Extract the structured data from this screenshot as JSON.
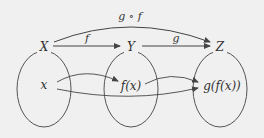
{
  "diagram": {
    "type": "function-composition-mapping",
    "background": "#f0f0f0",
    "stroke_color": "#555555",
    "sets": [
      {
        "id": "X",
        "label": "X",
        "element": "x"
      },
      {
        "id": "Y",
        "label": "Y",
        "element": "f(x)"
      },
      {
        "id": "Z",
        "label": "Z",
        "element": "g(f(x))"
      }
    ],
    "arrows": [
      {
        "from": "X",
        "to": "Y",
        "label": "f"
      },
      {
        "from": "Y",
        "to": "Z",
        "label": "g"
      },
      {
        "from": "X",
        "to": "Z",
        "label": "g ∘ f"
      }
    ],
    "element_arrows": [
      {
        "from": "x",
        "to": "f(x)"
      },
      {
        "from": "x",
        "to": "g(f(x))"
      },
      {
        "from": "f(x)",
        "to": "g(f(x))"
      }
    ]
  }
}
